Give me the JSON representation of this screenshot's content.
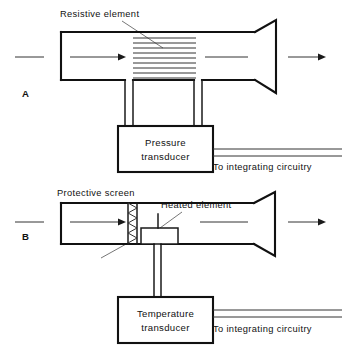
{
  "figure": {
    "kind": "technical-line-diagram",
    "background_color": "#ffffff",
    "line_color": "#111111"
  },
  "panels": [
    {
      "id": "A",
      "letter": "A",
      "callouts": [
        {
          "name": "resistive-element",
          "text": "Resistive element"
        }
      ],
      "sensor_box": {
        "line1": "Pressure",
        "line2": "transducer"
      },
      "output_label": "To integrating circuitry",
      "element_line_count": 9,
      "flow_arrows": 2
    },
    {
      "id": "B",
      "letter": "B",
      "callouts": [
        {
          "name": "protective-screen",
          "text": "Protective screen"
        },
        {
          "name": "heated-element",
          "text": "Heated element"
        }
      ],
      "sensor_box": {
        "line1": "Temperature",
        "line2": "transducer"
      },
      "output_label": "To integrating circuitry",
      "screen_zigzag_count": 8,
      "flow_arrows": 2
    }
  ]
}
